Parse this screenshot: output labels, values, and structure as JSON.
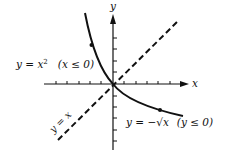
{
  "diagram": {
    "axes": {
      "x_label": "x",
      "y_label": "y",
      "origin_px": [
        113,
        84
      ],
      "tick_spacing_px": 11.4,
      "x_ticks_left": 5,
      "x_ticks_right": 6,
      "y_ticks_up": 4,
      "y_ticks_down": 6
    },
    "curves": [
      {
        "name": "parabola-left-branch",
        "equation_lhs": "y = x",
        "equation_exp": "2",
        "condition": "(x ≤ 0)",
        "style": "solid",
        "has_dot": true
      },
      {
        "name": "negative-root",
        "equation_text": "y = −√x",
        "condition": "(y ≤ 0)",
        "style": "solid",
        "has_dot": true
      },
      {
        "name": "identity-line",
        "equation_text": "y = x",
        "style": "dashed"
      }
    ],
    "colors": {
      "ink": "#111111",
      "background": "#ffffff"
    }
  }
}
